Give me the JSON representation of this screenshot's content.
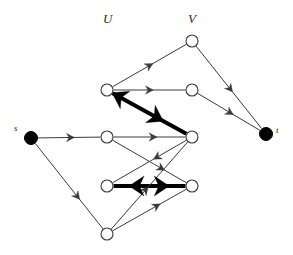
{
  "figure": {
    "width": 293,
    "height": 255,
    "background": "#ffffff",
    "stroke_color": "#3a3a3a",
    "thick_stroke_color": "#000000",
    "node_fill": "#ffffff",
    "node_stroke": "#3a3a3a",
    "terminal_fill": "#000000",
    "thin_width": 1,
    "thick_width": 4
  },
  "labels": {
    "set_u": "U",
    "set_v": "V",
    "source": "s",
    "sink": "t"
  },
  "label_positions": {
    "set_u": {
      "x": 103,
      "y": 12
    },
    "set_v": {
      "x": 188,
      "y": 12
    },
    "source": {
      "x": 14,
      "y": 124
    },
    "sink": {
      "x": 276,
      "y": 126
    }
  },
  "nodes": [
    {
      "id": "s",
      "name": "source-node",
      "x": 31,
      "y": 138,
      "r": 6.5,
      "filled": true,
      "label": "s"
    },
    {
      "id": "t",
      "name": "sink-node",
      "x": 266,
      "y": 134,
      "r": 6.5,
      "filled": true,
      "label": "t"
    },
    {
      "id": "u1",
      "name": "u-node-1",
      "x": 107,
      "y": 90,
      "r": 6,
      "filled": false,
      "label": ""
    },
    {
      "id": "u2",
      "name": "u-node-2",
      "x": 107,
      "y": 137,
      "r": 6,
      "filled": false,
      "label": ""
    },
    {
      "id": "u3",
      "name": "u-node-3",
      "x": 107,
      "y": 186,
      "r": 6,
      "filled": false,
      "label": ""
    },
    {
      "id": "u4",
      "name": "u-node-4",
      "x": 107,
      "y": 234,
      "r": 6,
      "filled": false,
      "label": ""
    },
    {
      "id": "v1",
      "name": "v-node-1",
      "x": 192,
      "y": 41,
      "r": 6,
      "filled": false,
      "label": ""
    },
    {
      "id": "v2",
      "name": "v-node-2",
      "x": 192,
      "y": 90,
      "r": 6,
      "filled": false,
      "label": ""
    },
    {
      "id": "v3",
      "name": "v-node-3",
      "x": 192,
      "y": 137,
      "r": 6,
      "filled": false,
      "label": ""
    },
    {
      "id": "v4",
      "name": "v-node-4",
      "x": 192,
      "y": 186,
      "r": 6,
      "filled": false,
      "label": ""
    }
  ],
  "edges": [
    {
      "id": "e1",
      "name": "edge-s-to-u2",
      "from": "s",
      "to": "u2",
      "thick": false,
      "arrows": [
        {
          "t": 0.52,
          "dir": 1
        }
      ]
    },
    {
      "id": "e2",
      "name": "edge-s-to-u4",
      "from": "s",
      "to": "u4",
      "thick": false,
      "arrows": [
        {
          "t": 0.62,
          "dir": 1
        }
      ]
    },
    {
      "id": "e3",
      "name": "edge-u1-to-v1",
      "from": "u1",
      "to": "v1",
      "thick": false,
      "arrows": [
        {
          "t": 0.5,
          "dir": 1
        }
      ]
    },
    {
      "id": "e4",
      "name": "edge-u1-to-v2",
      "from": "u1",
      "to": "v2",
      "thick": false,
      "arrows": [
        {
          "t": 0.5,
          "dir": 1
        }
      ]
    },
    {
      "id": "e5",
      "name": "edge-v3-to-u1",
      "from": "v3",
      "to": "u1",
      "thick": true,
      "arrows": [
        {
          "t": 0.92,
          "dir": 1
        },
        {
          "t": 0.4,
          "dir": -1
        }
      ]
    },
    {
      "id": "e6",
      "name": "edge-u2-to-v3",
      "from": "u2",
      "to": "v3",
      "thick": false,
      "arrows": [
        {
          "t": 0.55,
          "dir": 1
        }
      ]
    },
    {
      "id": "e7",
      "name": "edge-u2-to-v4",
      "from": "u2",
      "to": "v4",
      "thick": false,
      "arrows": [
        {
          "t": 0.66,
          "dir": 1
        }
      ]
    },
    {
      "id": "e8",
      "name": "edge-v3-to-u3",
      "from": "v3",
      "to": "u3",
      "thick": false,
      "arrows": [
        {
          "t": 0.4,
          "dir": 1
        }
      ]
    },
    {
      "id": "e9",
      "name": "edge-v4-to-u3",
      "from": "v4",
      "to": "u3",
      "thick": true,
      "arrows": [
        {
          "t": 0.68,
          "dir": 1
        },
        {
          "t": 0.33,
          "dir": -1
        }
      ]
    },
    {
      "id": "e10",
      "name": "edge-u4-to-v3",
      "from": "u4",
      "to": "v3",
      "thick": false,
      "arrows": [
        {
          "t": 0.45,
          "dir": 1
        }
      ]
    },
    {
      "id": "e11",
      "name": "edge-u4-to-v4",
      "from": "u4",
      "to": "v4",
      "thick": false,
      "arrows": [
        {
          "t": 0.6,
          "dir": 1
        }
      ]
    },
    {
      "id": "e12",
      "name": "edge-v1-to-t",
      "from": "v1",
      "to": "t",
      "thick": false,
      "arrows": [
        {
          "t": 0.52,
          "dir": 1
        }
      ]
    },
    {
      "id": "e13",
      "name": "edge-v2-to-t",
      "from": "v2",
      "to": "t",
      "thick": false,
      "arrows": [
        {
          "t": 0.52,
          "dir": 1
        }
      ]
    }
  ]
}
